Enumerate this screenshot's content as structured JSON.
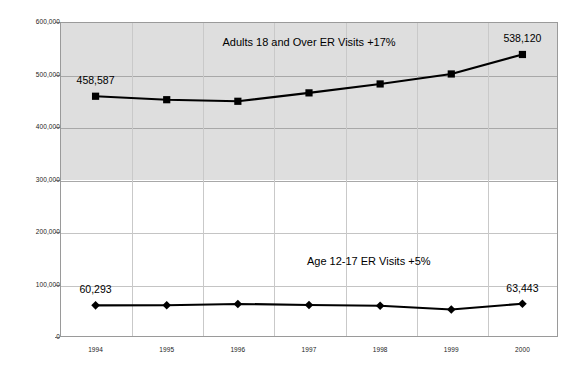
{
  "chart_data": {
    "type": "line",
    "title": "",
    "subtitle": "",
    "xlabel": "",
    "ylabel": "",
    "categories": [
      "1994",
      "1995",
      "1996",
      "1997",
      "1998",
      "1999",
      "2000"
    ],
    "ylim": [
      0,
      600000
    ],
    "ytick_labels": [
      "0",
      "100,000",
      "200,000",
      "300,000",
      "400,000",
      "500,000",
      "600,000"
    ],
    "ytick_values": [
      0,
      100000,
      200000,
      300000,
      400000,
      500000,
      600000
    ],
    "grid": true,
    "legend": "none",
    "legend_position": "inline-annotations",
    "series": [
      {
        "name": "Adults 18 and Over ER Visits",
        "marker": "square",
        "color": "#000000",
        "values": [
          458587,
          452000,
          449000,
          465000,
          482000,
          501000,
          538120
        ]
      },
      {
        "name": "Age 12-17 ER Visits",
        "marker": "diamond",
        "color": "#000000",
        "values": [
          60293,
          60500,
          63000,
          61000,
          59500,
          52500,
          63443
        ]
      }
    ],
    "annotations": [
      {
        "text": "Adults 18 and Over ER Visits +17%",
        "x_frac": 0.5,
        "y_value": 560000
      },
      {
        "text": "Age 12-17 ER Visits +5%",
        "x_frac": 0.62,
        "y_value": 142000
      }
    ],
    "data_labels": [
      {
        "text": "458,587",
        "series": 0,
        "index": 0
      },
      {
        "text": "538,120",
        "series": 0,
        "index": 6
      },
      {
        "text": "60,293",
        "series": 1,
        "index": 0
      },
      {
        "text": "63,443",
        "series": 1,
        "index": 6
      }
    ]
  },
  "colors": {
    "plot_band_upper": "#dedede",
    "plot_band_lower": "#ffffff",
    "gridline": "#a8a8a8",
    "series_line": "#000000",
    "axis_border": "#9a9a9a",
    "text": "#000000",
    "page_background": "#ffffff"
  }
}
